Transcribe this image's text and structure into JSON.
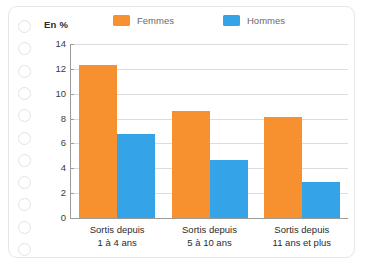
{
  "card": {
    "punch_holes": 11,
    "hole_icon": "punch-hole-icon"
  },
  "legend": {
    "position": "top",
    "items": [
      {
        "label": "Femmes",
        "color": "#F7902F",
        "swatch_icon": "orange-square-icon"
      },
      {
        "label": "Hommes",
        "color": "#35A3E8",
        "swatch_icon": "blue-square-icon"
      }
    ]
  },
  "axis": {
    "y_title": "En %",
    "y_ticks": [
      "0",
      "2",
      "4",
      "6",
      "8",
      "10",
      "12",
      "14"
    ]
  },
  "categories": [
    {
      "line1": "Sortis depuis",
      "line2": "1 à 4 ans"
    },
    {
      "line1": "Sortis depuis",
      "line2": "5 à 10 ans"
    },
    {
      "line1": "Sortis depuis",
      "line2": "11 ans et plus"
    }
  ],
  "chart_data": {
    "type": "bar",
    "title": "",
    "subtitle": "",
    "xlabel": "",
    "ylabel": "En %",
    "ylim": [
      0,
      14
    ],
    "ytick_step": 2,
    "yticks": [
      0,
      2,
      4,
      6,
      8,
      10,
      12,
      14
    ],
    "grid": true,
    "legend_position": "top",
    "categories": [
      "Sortis depuis 1 à 4 ans",
      "Sortis depuis 5 à 10 ans",
      "Sortis depuis 11 ans et plus"
    ],
    "series": [
      {
        "name": "Femmes",
        "color": "#F7902F",
        "values": [
          12.3,
          8.6,
          8.1
        ]
      },
      {
        "name": "Hommes",
        "color": "#35A3E8",
        "values": [
          6.8,
          4.65,
          2.9
        ]
      }
    ]
  }
}
